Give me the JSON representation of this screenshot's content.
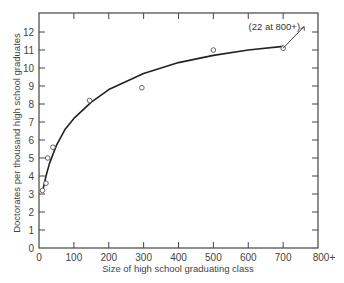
{
  "chart_data": {
    "type": "scatter",
    "title": "",
    "xlabel": "Size of high school graduating class",
    "ylabel": "Doctorates per thousand high school graduates",
    "xlim": [
      0,
      800
    ],
    "ylim": [
      0,
      12.8
    ],
    "x_ticks": [
      0,
      100,
      200,
      300,
      400,
      500,
      600,
      700,
      800
    ],
    "x_tick_labels": [
      "0",
      "100",
      "200",
      "300",
      "400",
      "500",
      "600",
      "700",
      "800+"
    ],
    "y_ticks": [
      0,
      1,
      2,
      3,
      4,
      5,
      6,
      7,
      8,
      9,
      10,
      11,
      12
    ],
    "y_tick_labels": [
      "0",
      "1",
      "2",
      "3",
      "4",
      "5",
      "6",
      "7",
      "8",
      "9",
      "10",
      "11",
      "12"
    ],
    "grid": false,
    "series": [
      {
        "name": "observed",
        "marker": "open-circle",
        "x": [
          10,
          20,
          25,
          40,
          145,
          295,
          500,
          700
        ],
        "y": [
          3.2,
          3.6,
          5.0,
          5.6,
          8.2,
          8.9,
          11.0,
          11.1
        ]
      },
      {
        "name": "fitted-curve",
        "style": "line",
        "x": [
          12,
          20,
          30,
          50,
          75,
          100,
          150,
          200,
          300,
          400,
          500,
          600,
          700
        ],
        "y": [
          3.3,
          4.0,
          4.7,
          5.7,
          6.6,
          7.2,
          8.1,
          8.8,
          9.7,
          10.3,
          10.7,
          11.0,
          11.2
        ]
      }
    ],
    "annotations": [
      {
        "text": "(22 at 800+)",
        "points_from": [
          700,
          11.1
        ],
        "arrow_to": [
          760,
          12.3
        ]
      }
    ]
  }
}
